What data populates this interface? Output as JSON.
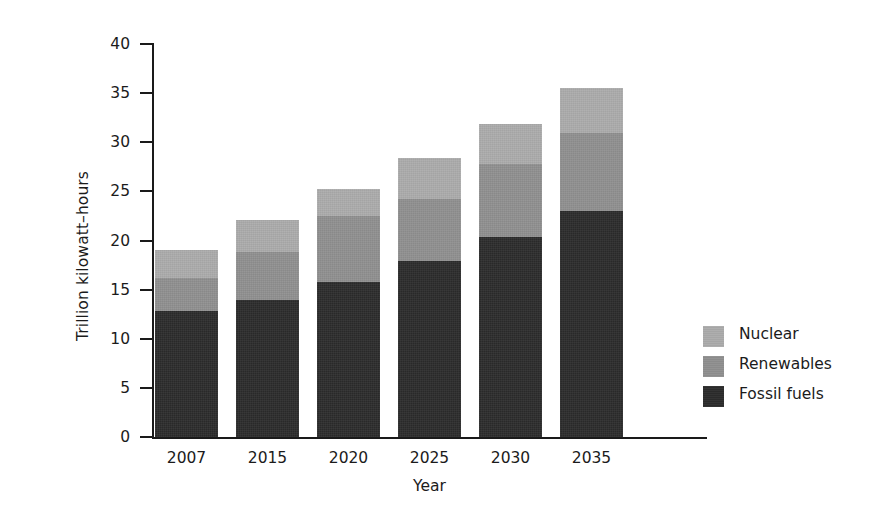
{
  "chart_data": {
    "type": "bar",
    "subtype": "stacked",
    "title": "",
    "xlabel": "Year",
    "ylabel": "Trillion kilowatt–hours",
    "categories": [
      "2007",
      "2015",
      "2020",
      "2025",
      "2030",
      "2035"
    ],
    "ylim": [
      0,
      40
    ],
    "yticks": [
      0,
      5,
      10,
      15,
      20,
      25,
      30,
      35,
      40
    ],
    "ytick_labels": [
      "0",
      "5",
      "10",
      "15",
      "20",
      "25",
      "30",
      "35",
      "40"
    ],
    "grid": false,
    "legend_position": "right",
    "stack_order_bottom_to_top": [
      "Fossil fuels",
      "Renewables",
      "Nuclear"
    ],
    "series": [
      {
        "name": "Fossil fuels",
        "color": "#2b2b2b",
        "values": [
          12.8,
          13.9,
          15.8,
          17.9,
          20.4,
          23.0
        ]
      },
      {
        "name": "Renewables",
        "color": "#8f8f8f",
        "values": [
          3.4,
          4.9,
          6.7,
          6.3,
          7.4,
          7.9
        ]
      },
      {
        "name": "Nuclear",
        "color": "#ababab",
        "values": [
          2.8,
          3.3,
          2.7,
          4.2,
          4.1,
          4.6
        ]
      }
    ],
    "cumulative_tops": {
      "fossil": [
        12.8,
        13.9,
        15.8,
        17.9,
        20.4,
        23.0
      ],
      "fossil_plus_renewables": [
        16.2,
        18.8,
        22.5,
        24.2,
        27.8,
        30.9
      ],
      "total": [
        19.0,
        22.1,
        25.2,
        28.4,
        31.9,
        35.5
      ]
    },
    "totals": [
      19.0,
      22.1,
      25.2,
      28.4,
      31.9,
      35.5
    ]
  },
  "legend": {
    "items": [
      {
        "label": "Nuclear",
        "color": "#ababab"
      },
      {
        "label": "Renewables",
        "color": "#8f8f8f"
      },
      {
        "label": "Fossil fuels",
        "color": "#2b2b2b"
      }
    ]
  },
  "axes": {
    "y_title": "Trillion kilowatt–hours",
    "x_title": "Year"
  }
}
